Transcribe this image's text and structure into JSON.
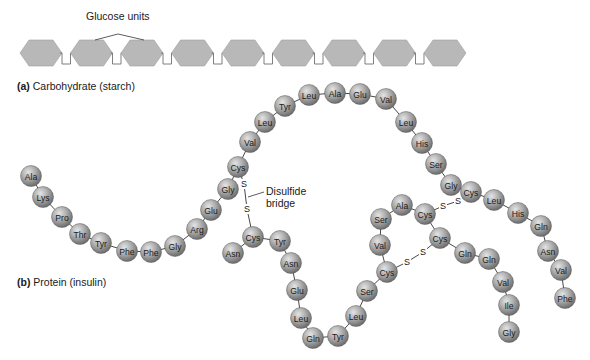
{
  "figure": {
    "carbohydrate": {
      "callout_label": "Glucose units",
      "caption_letter": "(a)",
      "caption_text": "Carbohydrate (starch)",
      "unit_count": 9,
      "hexagon_color": "#b8b8b8",
      "hexagon_stroke": "#a0a0a0",
      "link_color": "#707070"
    },
    "protein": {
      "caption_letter": "(b)",
      "caption_text": "Protein (insulin)",
      "bead_color": "#a6a6a6",
      "disulfide_label_line1": "Disulfide",
      "disulfide_label_line2": "bridge",
      "chain_b": [
        {
          "res": "Ala",
          "x": 31,
          "y": 176
        },
        {
          "res": "Lys",
          "x": 43,
          "y": 197
        },
        {
          "res": "Pro",
          "x": 62,
          "y": 217
        },
        {
          "res": "Thr",
          "x": 80,
          "y": 234
        },
        {
          "res": "Tyr",
          "x": 101,
          "y": 243
        },
        {
          "res": "Phe",
          "x": 127,
          "y": 251
        },
        {
          "res": "Phe",
          "x": 151,
          "y": 252
        },
        {
          "res": "Gly",
          "x": 175,
          "y": 246
        },
        {
          "res": "Arg",
          "x": 197,
          "y": 229
        },
        {
          "res": "Glu",
          "x": 211,
          "y": 210
        },
        {
          "res": "Gly",
          "x": 228,
          "y": 189
        },
        {
          "res": "Cys",
          "x": 238,
          "y": 167
        },
        {
          "res": "Val",
          "x": 250,
          "y": 142
        },
        {
          "res": "Leu",
          "x": 265,
          "y": 122
        },
        {
          "res": "Tyr",
          "x": 285,
          "y": 106
        },
        {
          "res": "Leu",
          "x": 309,
          "y": 95
        },
        {
          "res": "Ala",
          "x": 335,
          "y": 93
        },
        {
          "res": "Glu",
          "x": 360,
          "y": 94
        },
        {
          "res": "Val",
          "x": 386,
          "y": 99
        },
        {
          "res": "Leu",
          "x": 406,
          "y": 122
        },
        {
          "res": "His",
          "x": 422,
          "y": 143
        },
        {
          "res": "Ser",
          "x": 436,
          "y": 164
        },
        {
          "res": "Gly",
          "x": 451,
          "y": 185
        },
        {
          "res": "Cys",
          "x": 471,
          "y": 192
        },
        {
          "res": "Leu",
          "x": 494,
          "y": 200
        },
        {
          "res": "His",
          "x": 518,
          "y": 213
        },
        {
          "res": "Gln",
          "x": 541,
          "y": 226
        },
        {
          "res": "Asn",
          "x": 548,
          "y": 251
        },
        {
          "res": "Val",
          "x": 561,
          "y": 270
        },
        {
          "res": "Phe",
          "x": 565,
          "y": 298
        }
      ],
      "chain_a": [
        {
          "res": "Asn",
          "x": 233,
          "y": 253
        },
        {
          "res": "Cys",
          "x": 253,
          "y": 237
        },
        {
          "res": "Tyr",
          "x": 280,
          "y": 241
        },
        {
          "res": "Asn",
          "x": 291,
          "y": 263
        },
        {
          "res": "Glu",
          "x": 297,
          "y": 290
        },
        {
          "res": "Leu",
          "x": 301,
          "y": 318
        },
        {
          "res": "Gln",
          "x": 313,
          "y": 338
        },
        {
          "res": "Tyr",
          "x": 338,
          "y": 336
        },
        {
          "res": "Leu",
          "x": 356,
          "y": 316
        },
        {
          "res": "Ser",
          "x": 367,
          "y": 291
        },
        {
          "res": "Cys",
          "x": 387,
          "y": 272
        },
        {
          "res": "Val",
          "x": 380,
          "y": 245
        },
        {
          "res": "Ser",
          "x": 381,
          "y": 219
        },
        {
          "res": "Ala",
          "x": 402,
          "y": 205
        },
        {
          "res": "Cys",
          "x": 425,
          "y": 214
        },
        {
          "res": "Cys",
          "x": 440,
          "y": 238
        },
        {
          "res": "Gln",
          "x": 465,
          "y": 253
        },
        {
          "res": "Gln",
          "x": 489,
          "y": 259
        },
        {
          "res": "Val",
          "x": 503,
          "y": 282
        },
        {
          "res": "Ile",
          "x": 509,
          "y": 305
        },
        {
          "res": "Gly",
          "x": 509,
          "y": 332
        }
      ],
      "disulfide_bonds": [
        {
          "from": [
            238,
            167
          ],
          "s1": [
            244,
            184
          ],
          "s2": [
            247,
            209
          ],
          "to": [
            253,
            237
          ]
        },
        {
          "from": [
            425,
            214
          ],
          "s1": [
            443,
            206
          ],
          "s2": [
            458,
            201
          ],
          "to": [
            471,
            192
          ]
        },
        {
          "from": [
            387,
            272
          ],
          "s1": [
            407,
            262
          ],
          "s2": [
            423,
            252
          ],
          "to": [
            440,
            238
          ]
        }
      ],
      "sulfur_symbol": "S"
    }
  }
}
